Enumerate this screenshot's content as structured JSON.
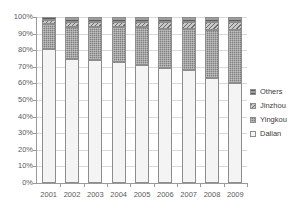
{
  "chart_data": {
    "type": "bar",
    "stacked": true,
    "normalized": "100%",
    "title": "",
    "xlabel": "",
    "ylabel": "",
    "ylim": [
      0,
      100
    ],
    "grid": true,
    "legend_position": "right",
    "categories": [
      "2001",
      "2002",
      "2003",
      "2004",
      "2005",
      "2006",
      "2007",
      "2008",
      "2009"
    ],
    "ytick_labels": [
      "100%",
      "90%",
      "80%",
      "70%",
      "60%",
      "50%",
      "40%",
      "30%",
      "20%",
      "10%",
      "0%"
    ],
    "ytick_values": [
      100,
      90,
      80,
      70,
      60,
      50,
      40,
      30,
      20,
      10,
      0
    ],
    "series": [
      {
        "name": "Dalian",
        "pattern": "empty",
        "color": "#f4f4f4",
        "values": [
          81,
          75,
          74,
          73,
          71,
          69,
          68,
          63,
          60
        ]
      },
      {
        "name": "Yingkou",
        "pattern": "fine-grid",
        "color": "#808080",
        "values": [
          15,
          19,
          20,
          21,
          23,
          24,
          25,
          29,
          32
        ]
      },
      {
        "name": "Jinzhou",
        "pattern": "diagonal-hatch",
        "color": "#c8c8c8",
        "values": [
          2,
          3,
          3,
          3,
          3,
          4,
          4,
          5,
          5
        ]
      },
      {
        "name": "Others",
        "pattern": "horizontal-hatch",
        "color": "#9e9e9e",
        "values": [
          2,
          3,
          3,
          3,
          3,
          3,
          3,
          3,
          3
        ]
      }
    ]
  },
  "legend": {
    "items": [
      {
        "label": "Others"
      },
      {
        "label": "Jinzhou"
      },
      {
        "label": "Yingkou"
      },
      {
        "label": "Dalian"
      }
    ]
  }
}
